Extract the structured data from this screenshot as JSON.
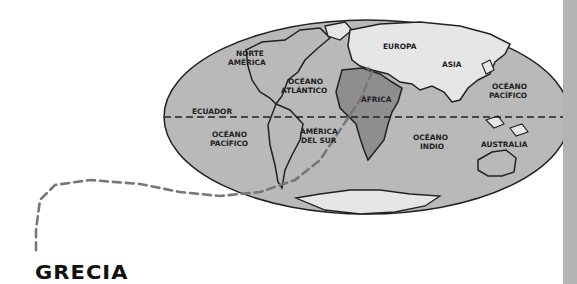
{
  "map": {
    "title": "GRECIA",
    "labels": {
      "north_america": [
        "NORTE",
        "AMÉRICA"
      ],
      "atlantic": [
        "OCÉANO",
        "ATLÁNTICO"
      ],
      "europe": "EUROPA",
      "asia": "ASIA",
      "pacific_east": [
        "OCÉANO",
        "PACÍFICO"
      ],
      "africa": "ÁFRICA",
      "equator": "ECUADOR",
      "pacific_west": [
        "OCÉANO",
        "PACÍFICO"
      ],
      "south_america": [
        "AMÉRICA",
        "DEL SUR"
      ],
      "indian": [
        "OCÉANO",
        "INDIO"
      ],
      "australia": "AUSTRALIA"
    },
    "colors": {
      "ocean": "#b9b9b9",
      "land": "#e6e6e6",
      "africa": "#8e8e8e",
      "route": "#777777",
      "outline": "#222222",
      "side_bar": "#b4b4b4"
    },
    "highlighted_region": "ÁFRICA",
    "route_marker": "star at Greece"
  }
}
